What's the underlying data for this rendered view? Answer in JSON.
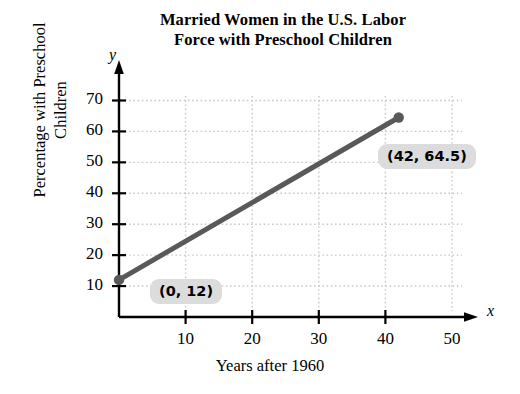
{
  "chart_data": {
    "type": "line",
    "title": "Married Women in the U.S. Labor Force with Preschool Children",
    "title_lines": [
      "Married Women in the U.S. Labor",
      "Force with Preschool Children"
    ],
    "xlabel": "Years after 1960",
    "ylabel": "Percentage with Preschool Children",
    "ylabel_lines": [
      "Percentage with Preschool",
      "Children"
    ],
    "x_axis_letter": "x",
    "y_axis_letter": "y",
    "x": [
      0,
      42
    ],
    "values": [
      12,
      64.5
    ],
    "series": [
      {
        "name": "Percentage with Preschool Children",
        "x": [
          0,
          42
        ],
        "values": [
          12,
          64.5
        ],
        "color": "#595959"
      }
    ],
    "xlim": [
      0,
      52
    ],
    "ylim": [
      0,
      75
    ],
    "xticks": [
      10,
      20,
      30,
      40,
      50
    ],
    "xtick_labels": [
      "10",
      "20",
      "30",
      "40",
      "50"
    ],
    "yticks": [
      10,
      20,
      30,
      40,
      50,
      60,
      70
    ],
    "ytick_labels": [
      "10",
      "20",
      "30",
      "40",
      "50",
      "60",
      "70"
    ],
    "grid": true,
    "grid_style": "dotted",
    "grid_color": "#c8c8c8",
    "legend": null,
    "annotations": [
      {
        "text": "(0, 12)",
        "x": 0,
        "y": 12
      },
      {
        "text": "(42, 64.5)",
        "x": 42,
        "y": 64.5
      }
    ],
    "point_markers": [
      {
        "x": 0,
        "y": 12
      },
      {
        "x": 42,
        "y": 64.5
      }
    ],
    "colors": {
      "line": "#595959",
      "marker": "#595959",
      "axis": "#000000",
      "grid": "#c8c8c8",
      "annotation_background": "#dcdcdc",
      "text": "#000000"
    }
  }
}
